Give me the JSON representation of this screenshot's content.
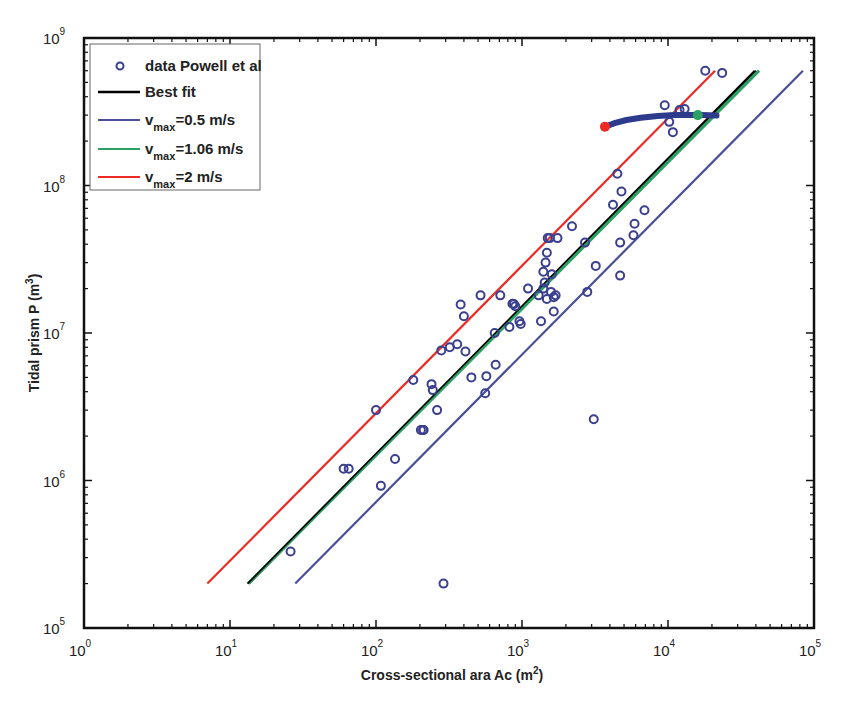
{
  "chart_data": {
    "type": "scatter",
    "title": "",
    "xlabel": "Cross-sectional ara Ac (m2)",
    "xlabel_parts": {
      "base": "Cross-sectional ara Ac (m",
      "sup": "2",
      "close": ")"
    },
    "ylabel": "Tidal prism P (m3)",
    "ylabel_parts": {
      "base": "Tidal prism P (m",
      "sup": "3",
      "close": ")"
    },
    "xscale": "log",
    "yscale": "log",
    "xlim": [
      1,
      100000
    ],
    "ylim": [
      100000,
      1000000000
    ],
    "x_ticks": [
      {
        "base": "10",
        "exp": "0"
      },
      {
        "base": "10",
        "exp": "1"
      },
      {
        "base": "10",
        "exp": "2"
      },
      {
        "base": "10",
        "exp": "3"
      },
      {
        "base": "10",
        "exp": "4"
      },
      {
        "base": "10",
        "exp": "5"
      }
    ],
    "y_ticks": [
      {
        "base": "10",
        "exp": "5"
      },
      {
        "base": "10",
        "exp": "6"
      },
      {
        "base": "10",
        "exp": "7"
      },
      {
        "base": "10",
        "exp": "8"
      },
      {
        "base": "10",
        "exp": "9"
      }
    ],
    "grid": false,
    "legend_position": "upper left",
    "legend": [
      {
        "label": "data Powell et al",
        "type": "marker",
        "color": "#3b3f8f"
      },
      {
        "label": "Best fit",
        "type": "line",
        "color": "#000000"
      },
      {
        "label": "v",
        "sub": "max",
        "rest": "=0.5 m/s",
        "type": "line",
        "color": "#4a4f99"
      },
      {
        "label": "v",
        "sub": "max",
        "rest": "=1.06 m/s",
        "type": "line",
        "color": "#2aa063"
      },
      {
        "label": "v",
        "sub": "max",
        "rest": "=2 m/s",
        "type": "line",
        "color": "#ee2a24"
      }
    ],
    "series": [
      {
        "name": "data Powell et al",
        "type": "scatter",
        "marker": "open-circle",
        "color": "#3b3f8f",
        "points": [
          [
            26,
            330000
          ],
          [
            290,
            200000
          ],
          [
            3100,
            2600000
          ],
          [
            60,
            1200000
          ],
          [
            65,
            1200000
          ],
          [
            108,
            920000
          ],
          [
            135,
            1400000
          ],
          [
            100,
            3000000
          ],
          [
            180,
            4800000
          ],
          [
            203,
            2200000
          ],
          [
            210,
            2200000
          ],
          [
            212,
            2200000
          ],
          [
            240,
            4500000
          ],
          [
            245,
            4100000
          ],
          [
            262,
            3000000
          ],
          [
            280,
            7600000
          ],
          [
            320,
            8000000
          ],
          [
            360,
            8400000
          ],
          [
            380,
            15600000
          ],
          [
            400,
            13000000
          ],
          [
            410,
            7500000
          ],
          [
            450,
            5000000
          ],
          [
            520,
            18000000
          ],
          [
            560,
            3900000
          ],
          [
            570,
            5100000
          ],
          [
            660,
            6100000
          ],
          [
            650,
            10000000
          ],
          [
            710,
            18000000
          ],
          [
            820,
            11000000
          ],
          [
            860,
            15800000
          ],
          [
            880,
            15700000
          ],
          [
            900,
            15200000
          ],
          [
            960,
            12000000
          ],
          [
            980,
            11500000
          ],
          [
            1100,
            20000000
          ],
          [
            1300,
            18000000
          ],
          [
            1350,
            12000000
          ],
          [
            1400,
            20000000
          ],
          [
            1400,
            26000000
          ],
          [
            1430,
            22000000
          ],
          [
            1450,
            30000000
          ],
          [
            1480,
            35000000
          ],
          [
            1480,
            17000000
          ],
          [
            1500,
            44000000
          ],
          [
            1550,
            44000000
          ],
          [
            1580,
            19000000
          ],
          [
            1600,
            25000000
          ],
          [
            1650,
            17500000
          ],
          [
            1650,
            14000000
          ],
          [
            1700,
            18000000
          ],
          [
            1750,
            44000000
          ],
          [
            2200,
            53000000
          ],
          [
            2700,
            41000000
          ],
          [
            2800,
            19000000
          ],
          [
            3200,
            28500000
          ],
          [
            4200,
            74000000
          ],
          [
            4500,
            120000000
          ],
          [
            4700,
            41000000
          ],
          [
            4800,
            91000000
          ],
          [
            4700,
            24500000
          ],
          [
            5800,
            46000000
          ],
          [
            5900,
            55000000
          ],
          [
            6900,
            68000000
          ],
          [
            9500,
            350000000
          ],
          [
            10200,
            270000000
          ],
          [
            10800,
            230000000
          ],
          [
            12000,
            325000000
          ],
          [
            13000,
            330000000
          ],
          [
            18000,
            600000000
          ],
          [
            23500,
            580000000
          ]
        ]
      },
      {
        "name": "Best fit",
        "type": "line",
        "color": "#000000",
        "points": [
          [
            13.5,
            200000
          ],
          [
            40000,
            600000000
          ]
        ]
      },
      {
        "name": "vmax=0.5 m/s",
        "type": "line",
        "color": "#4a4f99",
        "points": [
          [
            28,
            200000
          ],
          [
            84000,
            600000000
          ]
        ]
      },
      {
        "name": "vmax=1.06 m/s",
        "type": "line",
        "color": "#2aa063",
        "points": [
          [
            13.3,
            200000
          ],
          [
            42000,
            600000000
          ]
        ]
      },
      {
        "name": "vmax=2 m/s",
        "type": "line",
        "color": "#ee2a24",
        "points": [
          [
            7,
            200000
          ],
          [
            21000,
            600000000
          ]
        ]
      },
      {
        "name": "trajectory",
        "type": "thick-line",
        "color": "#2e3a8c",
        "points": [
          [
            3700,
            250000000
          ],
          [
            4300,
            265000000
          ],
          [
            5200,
            278000000
          ],
          [
            6500,
            288000000
          ],
          [
            8500,
            296000000
          ],
          [
            11000,
            300000000
          ],
          [
            14000,
            300000000
          ],
          [
            17000,
            300000000
          ],
          [
            21500,
            298000000
          ]
        ]
      }
    ],
    "annotations": [
      {
        "type": "dot",
        "color": "#ee2a24",
        "x": 3700,
        "y": 250000000
      },
      {
        "type": "dot",
        "color": "#2aa063",
        "x": 16000,
        "y": 300000000
      }
    ]
  }
}
